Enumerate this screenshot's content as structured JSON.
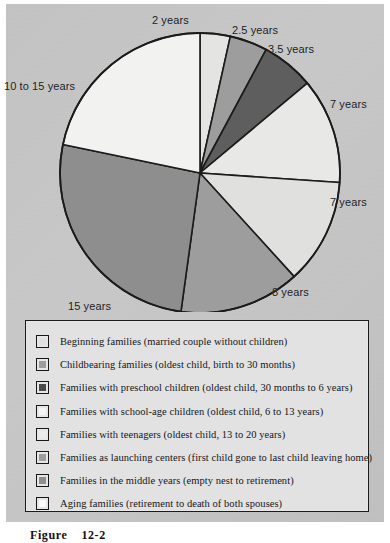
{
  "figure": {
    "caption_label": "Figure",
    "caption_number": "12-2"
  },
  "colors": {
    "panel_background": "#c4c4c4",
    "outline": "#1b1b1b",
    "legend_background": "#e2e2e2",
    "slice_very_light": "#f2f2f0",
    "slice_light": "#e4e4e2",
    "slice_light_gray": "#dcdcda",
    "slice_medium": "#9d9d9d",
    "slice_medium_dark": "#8e8e8e",
    "slice_dark": "#5e5e5e",
    "slice_darkest": "#4a4a4a"
  },
  "chart_data": {
    "type": "pie",
    "title": "",
    "unit": "years",
    "total_years": 55,
    "start_angle_deg": -90,
    "direction": "clockwise",
    "categories": [
      "Beginning families",
      "Childbearing families",
      "Families with preschool children",
      "Families with school-age children",
      "Families with teenagers",
      "Families as launching centers",
      "Families in the middle years",
      "Aging families"
    ],
    "values": [
      2,
      2.5,
      3.5,
      7,
      7,
      8,
      15,
      12.5
    ],
    "slice_labels": [
      "2 years",
      "2.5 years",
      "3.5 years",
      "7 years",
      "7 years",
      "8 years",
      "15 years",
      "10 to 15 years"
    ],
    "slice_colors": [
      "#e4e4e2",
      "#9d9d9d",
      "#5e5e5e",
      "#e8e8e6",
      "#e0e0de",
      "#9d9d9d",
      "#8e8e8e",
      "#f2f2f0"
    ],
    "legend_position": "below"
  },
  "pie_labels": [
    {
      "text": "2 years",
      "x": 152,
      "y": 14
    },
    {
      "text": "2.5 years",
      "x": 232,
      "y": 24
    },
    {
      "text": "3.5 years",
      "x": 268,
      "y": 43
    },
    {
      "text": "7 years",
      "x": 330,
      "y": 98
    },
    {
      "text": "7 years",
      "x": 330,
      "y": 196
    },
    {
      "text": "8 years",
      "x": 272,
      "y": 286
    },
    {
      "text": "15 years",
      "x": 68,
      "y": 300
    },
    {
      "text": "10 to 15 years",
      "x": 4,
      "y": 80
    }
  ],
  "legend": {
    "items": [
      {
        "swatch_color": "#e0e0de",
        "label": "Beginning families (married couple without children)"
      },
      {
        "swatch_color": "#9d9d9d",
        "label": "Childbearing families (oldest child, birth to 30 months)"
      },
      {
        "swatch_color": "#4a4a4a",
        "label": "Families with preschool children (oldest child, 30 months to 6 years)"
      },
      {
        "swatch_color": "#f4f4f2",
        "label": "Families with school-age children (oldest child, 6 to 13 years)"
      },
      {
        "swatch_color": "#ebebe9",
        "label": "Families with teenagers (oldest child, 13 to 20 years)"
      },
      {
        "swatch_color": "#9d9d9d",
        "label": "Families as launching centers (first child gone to last child leaving home)"
      },
      {
        "swatch_color": "#8e8e8e",
        "label": "Families in the middle years (empty nest to retirement)"
      },
      {
        "swatch_color": "#fbfbfa",
        "label": "Aging families (retirement to death of both spouses)"
      }
    ]
  }
}
